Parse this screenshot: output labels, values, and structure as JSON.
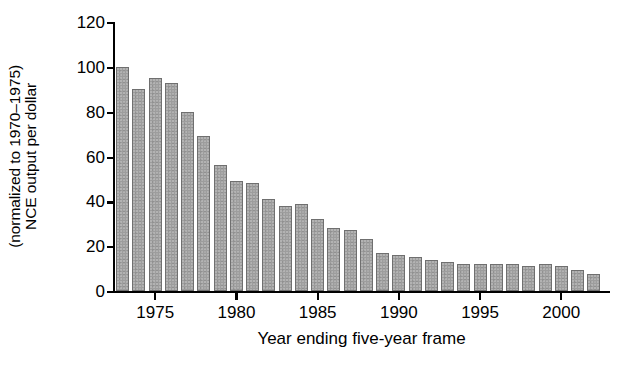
{
  "chart_data": {
    "type": "bar",
    "title": "",
    "xlabel": "Year ending five-year frame",
    "ylabel_line1": "NCE output per dollar",
    "ylabel_line2": "(normalized to 1970–1975)",
    "ylim": [
      0,
      120
    ],
    "xlim": [
      1972.4,
      2003.0
    ],
    "grid": false,
    "legend": null,
    "ytick_labels": [
      "0",
      "20",
      "40",
      "60",
      "80",
      "100",
      "120"
    ],
    "ytick_values": [
      0,
      20,
      40,
      60,
      80,
      100,
      120
    ],
    "xtick_labels": [
      "1975",
      "1980",
      "1985",
      "1990",
      "1995",
      "2000"
    ],
    "xtick_values": [
      1975,
      1980,
      1985,
      1990,
      1995,
      2000
    ],
    "bar_color": "#9d9d9d",
    "bar_edge_color": "#6f6f6f",
    "categories": [
      1973,
      1974,
      1975,
      1976,
      1977,
      1978,
      1979,
      1980,
      1981,
      1982,
      1983,
      1984,
      1985,
      1986,
      1987,
      1988,
      1989,
      1990,
      1991,
      1992,
      1993,
      1994,
      1995,
      1996,
      1997,
      1998,
      1999,
      2000,
      2001,
      2002
    ],
    "values": [
      100,
      90,
      95,
      93,
      80,
      69,
      56,
      49,
      48,
      41,
      38,
      39,
      32,
      28,
      27,
      23,
      17,
      16,
      15,
      14,
      13,
      12,
      12,
      12,
      12,
      11,
      12,
      11,
      9.5,
      7.5
    ]
  }
}
